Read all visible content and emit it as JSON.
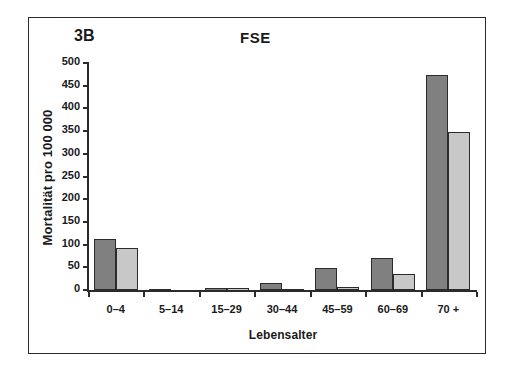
{
  "figure": {
    "panel_label": "3B",
    "title": "FSE"
  },
  "chart_data": {
    "type": "bar",
    "title": "FSE",
    "panel_label": "3B",
    "xlabel": "Lebensalter",
    "ylabel": "Mortalität pro 100 000",
    "categories": [
      "0–4",
      "5–14",
      "15–29",
      "30–44",
      "45–59",
      "60–69",
      "70 +"
    ],
    "series": [
      {
        "name": "series-1",
        "color": "#808080",
        "values": [
          112,
          2,
          5,
          15,
          48,
          70,
          473
        ]
      },
      {
        "name": "series-2",
        "color": "#c8c8c8",
        "values": [
          92,
          0,
          5,
          2,
          7,
          35,
          348
        ]
      }
    ],
    "ylim": [
      0,
      500
    ],
    "yticks": [
      0,
      50,
      100,
      150,
      200,
      250,
      300,
      350,
      400,
      450,
      500
    ],
    "ytick_labels": [
      "0",
      "50",
      "100",
      "150",
      "200",
      "250",
      "300",
      "350",
      "400",
      "450",
      "500"
    ],
    "grid": false,
    "legend": null,
    "axis_colors": {
      "axis": "#2b2b2b",
      "frame": "#2b2b2b"
    }
  }
}
